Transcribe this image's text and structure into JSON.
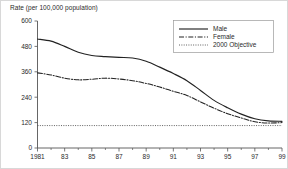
{
  "chart_data": {
    "type": "line",
    "title": "",
    "ylabel": "Rate (per 100,000 population)",
    "xlabel": "",
    "ylim": [
      0,
      600
    ],
    "xlim": [
      1981,
      1999
    ],
    "grid": false,
    "legend_position": "top-right",
    "y_ticks": [
      "0",
      "120",
      "240",
      "360",
      "480",
      "600"
    ],
    "y_tick_values": [
      0,
      120,
      240,
      360,
      480,
      600
    ],
    "x_ticks": [
      "1981",
      "83",
      "85",
      "87",
      "89",
      "91",
      "93",
      "95",
      "97",
      "99"
    ],
    "x_tick_values": [
      1981,
      1983,
      1985,
      1987,
      1989,
      1991,
      1993,
      1995,
      1997,
      1999
    ],
    "x": [
      1981,
      1982,
      1983,
      1984,
      1985,
      1986,
      1987,
      1988,
      1989,
      1990,
      1991,
      1992,
      1993,
      1994,
      1995,
      1996,
      1997,
      1998,
      1999
    ],
    "series": [
      {
        "name": "Male",
        "style": "solid",
        "values": [
          515,
          505,
          480,
          452,
          437,
          432,
          428,
          425,
          410,
          382,
          352,
          318,
          272,
          225,
          190,
          160,
          138,
          128,
          126
        ]
      },
      {
        "name": "Female",
        "style": "dash-dot",
        "values": [
          355,
          345,
          330,
          322,
          325,
          330,
          326,
          318,
          305,
          288,
          268,
          248,
          218,
          188,
          162,
          142,
          124,
          118,
          120
        ]
      },
      {
        "name": "2000 Objective",
        "style": "dotted",
        "constant": 106,
        "values": [
          106,
          106,
          106,
          106,
          106,
          106,
          106,
          106,
          106,
          106,
          106,
          106,
          106,
          106,
          106,
          106,
          106,
          106,
          106
        ]
      }
    ]
  },
  "legend": {
    "entries": [
      {
        "label": "Male"
      },
      {
        "label": "Female"
      },
      {
        "label": "2000 Objective"
      }
    ]
  },
  "colors": {
    "ink": "#222222",
    "axis": "#555555",
    "border": "#d8d8d8"
  }
}
